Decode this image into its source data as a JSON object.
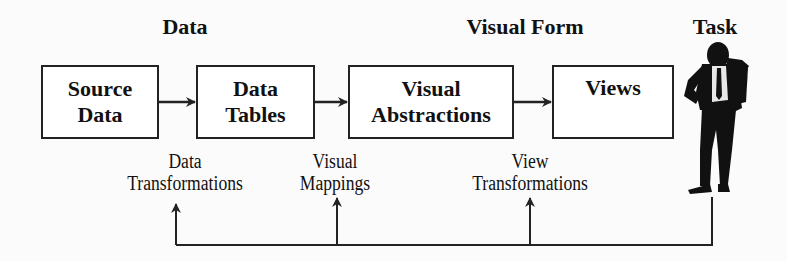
{
  "headers": {
    "data": "Data",
    "visual_form": "Visual Form",
    "task": "Task"
  },
  "boxes": [
    {
      "line1": "Source",
      "line2": "Data"
    },
    {
      "line1": "Data",
      "line2": "Tables"
    },
    {
      "line1": "Visual",
      "line2": "Abstractions"
    },
    {
      "line1": "Views",
      "line2": ""
    }
  ],
  "transformations": [
    {
      "line1": "Data",
      "line2": "Transformations"
    },
    {
      "line1": "Visual",
      "line2": "Mappings"
    },
    {
      "line1": "View",
      "line2": "Transformations"
    }
  ],
  "figure": {
    "icon": "person-thinking-icon"
  },
  "colors": {
    "stroke": "#222222",
    "background": "#fbfbfb"
  }
}
